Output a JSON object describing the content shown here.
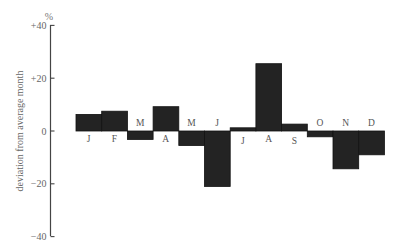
{
  "chart_data": {
    "type": "bar",
    "title": "",
    "xlabel": "",
    "ylabel": "deviation from average month",
    "y_unit": "%",
    "ylim": [
      -40,
      40
    ],
    "yticks": [
      40,
      20,
      0,
      -20,
      -40
    ],
    "ytick_labels": [
      "+40",
      "+20",
      "0",
      "−20",
      "−40"
    ],
    "grid": false,
    "legend": null,
    "categories": [
      "J",
      "F",
      "M",
      "A",
      "M",
      "J",
      "J",
      "A",
      "S",
      "O",
      "N",
      "D"
    ],
    "category_meaning": [
      "Jan",
      "Feb",
      "Mar",
      "Apr",
      "May",
      "Jun",
      "Jul",
      "Aug",
      "Sep",
      "Oct",
      "Nov",
      "Dec"
    ],
    "values": [
      6.3,
      7.5,
      -3.2,
      9.2,
      -5.5,
      -21,
      1.2,
      25.5,
      2.6,
      -2.2,
      -14.3,
      -9
    ],
    "colors": {
      "bar": "#232323",
      "axis": "#444444",
      "text": "#5a5a5a"
    }
  }
}
